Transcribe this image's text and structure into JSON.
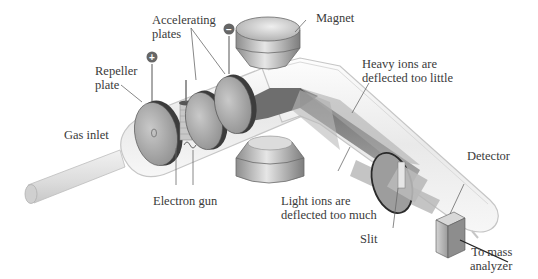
{
  "diagram": {
    "labels": {
      "accelerating_plates": "Accelerating\nplates",
      "magnet": "Magnet",
      "repeller_plate": "Repeller\nplate",
      "gas_inlet": "Gas inlet",
      "electron_gun": "Electron gun",
      "heavy_ions": "Heavy ions are\ndeflected too little",
      "light_ions": "Light ions are\ndeflected too much",
      "slit": "Slit",
      "detector": "Detector",
      "to_mass_analyzer": "To mass\nanalyzer"
    },
    "terminals": {
      "repeller_sign": "+",
      "accelerator_sign": "−"
    },
    "colors": {
      "tube_outline": "#c8c8c8",
      "tube_fill": "#f3f3f3",
      "plate_fill": "#a9a9a9",
      "plate_rim": "#3c3c3c",
      "beam": "#8a8a8a",
      "magnet": "#b5b5b5",
      "text": "#3a3a3a",
      "leader": "#6a6a6a"
    }
  }
}
